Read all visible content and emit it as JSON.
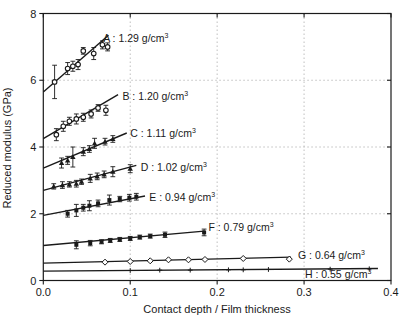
{
  "chart_data": {
    "type": "scatter",
    "title": "",
    "xlabel": "Contact depth / Film thickness",
    "ylabel": "Reduced modulus (GPa)",
    "xlim": [
      0,
      0.4
    ],
    "ylim": [
      0,
      8
    ],
    "x_ticks": [
      0,
      0.1,
      0.2,
      0.3,
      0.4
    ],
    "x_tick_labels": [
      "0.0",
      "0.1",
      "0.2",
      "0.3",
      "0.4"
    ],
    "y_ticks": [
      0,
      2,
      4,
      6,
      8
    ],
    "y_tick_labels": [
      "0",
      "2",
      "4",
      "6",
      "8"
    ],
    "grid": {
      "x": [
        0.1,
        0.2,
        0.3
      ],
      "y": [
        2,
        4,
        6
      ],
      "style": "dotted"
    },
    "legend_position": "inline-labels",
    "colors": {
      "data": "#1a1a1a",
      "grid": "#b8b8b8",
      "frame": "#1a1a1a"
    },
    "series": [
      {
        "name": "A",
        "label": "A : 1.29 g/cm",
        "label_sup": "3",
        "density_g_cm3": 1.29,
        "marker": "circle-open",
        "label_anchor": [
          0.069,
          7.25
        ],
        "fit_line": [
          [
            0,
            5.65
          ],
          [
            0.075,
            7.35
          ]
        ],
        "points": [
          [
            0.013,
            5.95,
            0.5
          ],
          [
            0.028,
            6.35,
            0.18
          ],
          [
            0.034,
            6.42,
            0.15
          ],
          [
            0.04,
            6.47,
            0.15
          ],
          [
            0.046,
            6.88,
            0.1
          ],
          [
            0.058,
            6.8,
            0.18
          ],
          [
            0.068,
            7.06,
            0.12
          ],
          [
            0.074,
            7.0,
            0.12
          ]
        ]
      },
      {
        "name": "B",
        "label": "B : 1.20 g/cm",
        "label_sup": "3",
        "density_g_cm3": 1.2,
        "marker": "circle-open",
        "label_anchor": [
          0.091,
          5.51
        ],
        "fit_line": [
          [
            0,
            4.25
          ],
          [
            0.086,
            5.57
          ]
        ],
        "points": [
          [
            0.015,
            4.37,
            0.18
          ],
          [
            0.023,
            4.62,
            0.15
          ],
          [
            0.03,
            4.77,
            0.12
          ],
          [
            0.038,
            4.84,
            0.15
          ],
          [
            0.046,
            4.89,
            0.12
          ],
          [
            0.055,
            4.99,
            0.12
          ],
          [
            0.063,
            5.17,
            0.1
          ],
          [
            0.072,
            5.1,
            0.15
          ]
        ]
      },
      {
        "name": "C",
        "label": "C : 1.11 g/cm",
        "label_sup": "3",
        "density_g_cm3": 1.11,
        "marker": "triangle",
        "label_anchor": [
          0.1,
          4.39
        ],
        "fit_line": [
          [
            0,
            3.37
          ],
          [
            0.096,
            4.42
          ]
        ],
        "points": [
          [
            0.021,
            3.52,
            0.15
          ],
          [
            0.028,
            3.6,
            0.12
          ],
          [
            0.034,
            3.7,
            0.3
          ],
          [
            0.046,
            3.86,
            0.12
          ],
          [
            0.053,
            3.94,
            0.1
          ],
          [
            0.059,
            4.11,
            0.15
          ],
          [
            0.071,
            4.16,
            0.1
          ],
          [
            0.08,
            4.24,
            0.1
          ]
        ]
      },
      {
        "name": "D",
        "label": "D : 1.02 g/cm",
        "label_sup": "3",
        "density_g_cm3": 1.02,
        "marker": "triangle",
        "label_anchor": [
          0.112,
          3.38
        ],
        "fit_line": [
          [
            0,
            2.7
          ],
          [
            0.107,
            3.45
          ]
        ],
        "points": [
          [
            0.012,
            2.82,
            0.08
          ],
          [
            0.022,
            2.86,
            0.1
          ],
          [
            0.03,
            2.88,
            0.08
          ],
          [
            0.038,
            2.9,
            0.1
          ],
          [
            0.044,
            2.96,
            0.08
          ],
          [
            0.054,
            3.06,
            0.12
          ],
          [
            0.062,
            3.12,
            0.1
          ],
          [
            0.07,
            3.18,
            0.1
          ],
          [
            0.08,
            3.26,
            0.15
          ],
          [
            0.1,
            3.35,
            0.12
          ]
        ]
      },
      {
        "name": "E",
        "label": "E : 0.94 g/cm",
        "label_sup": "3",
        "density_g_cm3": 0.94,
        "marker": "square",
        "label_anchor": [
          0.122,
          2.49
        ],
        "fit_line": [
          [
            0,
            1.95
          ],
          [
            0.117,
            2.53
          ]
        ],
        "points": [
          [
            0.028,
            2.0,
            0.1
          ],
          [
            0.038,
            2.1,
            0.18
          ],
          [
            0.046,
            2.18,
            0.1
          ],
          [
            0.053,
            2.24,
            0.15
          ],
          [
            0.063,
            2.31,
            0.1
          ],
          [
            0.076,
            2.41,
            0.15
          ],
          [
            0.088,
            2.44,
            0.08
          ],
          [
            0.099,
            2.48,
            0.1
          ],
          [
            0.107,
            2.51,
            0.1
          ]
        ]
      },
      {
        "name": "F",
        "label": "F : 0.79 g/cm",
        "label_sup": "3",
        "density_g_cm3": 0.79,
        "marker": "square",
        "label_anchor": [
          0.19,
          1.59
        ],
        "fit_line": [
          [
            0,
            1.05
          ],
          [
            0.185,
            1.48
          ]
        ],
        "points": [
          [
            0.038,
            1.07,
            0.12
          ],
          [
            0.054,
            1.12,
            0.08
          ],
          [
            0.067,
            1.16,
            0.06
          ],
          [
            0.077,
            1.2,
            0.06
          ],
          [
            0.088,
            1.23,
            0.06
          ],
          [
            0.1,
            1.26,
            0.06
          ],
          [
            0.111,
            1.3,
            0.06
          ],
          [
            0.123,
            1.33,
            0.06
          ],
          [
            0.14,
            1.37,
            0.08
          ],
          [
            0.185,
            1.44,
            0.1
          ]
        ]
      },
      {
        "name": "G",
        "label": "G : 0.64 g/cm",
        "label_sup": "3",
        "density_g_cm3": 0.64,
        "marker": "diamond-open",
        "label_anchor": [
          0.293,
          0.75
        ],
        "fit_line": [
          [
            0,
            0.52
          ],
          [
            0.285,
            0.7
          ]
        ],
        "points": [
          [
            0.071,
            0.55,
            0
          ],
          [
            0.1,
            0.57,
            0
          ],
          [
            0.123,
            0.59,
            0
          ],
          [
            0.144,
            0.62,
            0
          ],
          [
            0.167,
            0.62,
            0
          ],
          [
            0.186,
            0.63,
            0
          ],
          [
            0.23,
            0.66,
            0
          ],
          [
            0.283,
            0.64,
            0
          ]
        ]
      },
      {
        "name": "H",
        "label": "H : 0.55 g/cm",
        "label_sup": "3",
        "density_g_cm3": 0.55,
        "marker": "plus",
        "label_anchor": [
          0.301,
          0.17
        ],
        "fit_line": [
          [
            0,
            0.28
          ],
          [
            0.385,
            0.36
          ]
        ],
        "points": [
          [
            0.1,
            0.3,
            0
          ],
          [
            0.134,
            0.31,
            0
          ],
          [
            0.169,
            0.31,
            0
          ],
          [
            0.213,
            0.32,
            0
          ],
          [
            0.23,
            0.32,
            0
          ],
          [
            0.259,
            0.33,
            0
          ],
          [
            0.33,
            0.34,
            0
          ],
          [
            0.375,
            0.35,
            0
          ]
        ]
      }
    ]
  }
}
